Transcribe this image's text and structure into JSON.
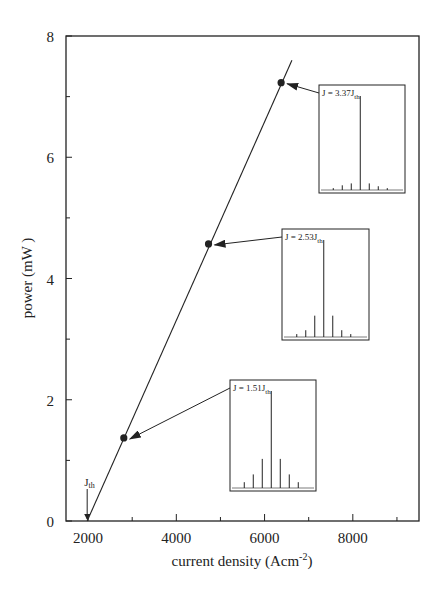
{
  "chart_data": {
    "type": "line",
    "title": "",
    "xlabel": "current density (Acm⁻²)",
    "xlabel_base": "current density (Acm",
    "xlabel_sup": "-2",
    "xlabel_close": ")",
    "ylabel": "power (mW )",
    "xlim": [
      1500,
      9500
    ],
    "ylim": [
      0,
      8
    ],
    "x_ticks": [
      2000,
      4000,
      6000,
      8000
    ],
    "x_tick_labels": [
      "2000",
      "4000",
      "6000",
      "8000"
    ],
    "x_minor_ticks": [
      3000,
      5000,
      7000,
      9000
    ],
    "y_ticks": [
      0,
      2,
      4,
      6,
      8
    ],
    "y_tick_labels": [
      "0",
      "2",
      "4",
      "6",
      "8"
    ],
    "y_minor_ticks": [
      1,
      3,
      5,
      7
    ],
    "grid": false,
    "legend": null,
    "series": [
      {
        "name": "L-I curve",
        "style": "line",
        "x": [
          1980,
          6620
        ],
        "y": [
          0,
          7.6
        ]
      },
      {
        "name": "measured points",
        "style": "markers",
        "x": [
          2810,
          4730,
          6375
        ],
        "y": [
          1.37,
          4.57,
          7.23
        ]
      }
    ],
    "annotations": [
      {
        "text": "J",
        "sub": "th",
        "type": "arrow-down",
        "x": 1980,
        "y": 0
      },
      {
        "text": "J = 1.51J",
        "sub": "th",
        "type": "inset-spectrum",
        "points_to_index": 0,
        "peaks": [
          0.06,
          0.14,
          0.3,
          1.0,
          0.3,
          0.14,
          0.06
        ]
      },
      {
        "text": "J = 2.53J",
        "sub": "th",
        "type": "inset-spectrum",
        "points_to_index": 1,
        "peaks": [
          0.03,
          0.07,
          0.22,
          1.0,
          0.22,
          0.07,
          0.03
        ]
      },
      {
        "text": "J = 3.37J",
        "sub": "th",
        "type": "inset-spectrum",
        "points_to_index": 2,
        "peaks": [
          0.02,
          0.05,
          0.07,
          1.0,
          0.07,
          0.04,
          0.02
        ]
      }
    ]
  },
  "style": {
    "ink": "#222222",
    "background": "#ffffff"
  }
}
